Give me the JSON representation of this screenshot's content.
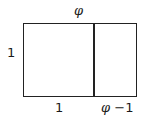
{
  "diagram": {
    "labels": {
      "top": "φ",
      "left": "1",
      "bottom_left": "1",
      "bottom_right_symbol": "φ",
      "bottom_right_rest": " −1"
    }
  }
}
